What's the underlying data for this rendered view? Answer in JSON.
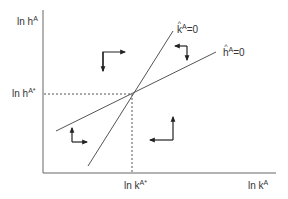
{
  "diagram": {
    "type": "phase-diagram",
    "axes": {
      "y_label": {
        "base": "ln h",
        "sup": "A"
      },
      "x_label": {
        "base": "ln k",
        "sup": "A"
      },
      "y_star_label": {
        "base": "ln h",
        "sup": "A*"
      },
      "x_star_label": {
        "base": "ln k",
        "sup": "A*"
      }
    },
    "curves": [
      {
        "id": "k-hat-locus",
        "label_base": "k",
        "label_sup": "A",
        "label_suffix": "=0",
        "slope": "steep"
      },
      {
        "id": "h-hat-locus",
        "label_base": "h",
        "label_sup": "A",
        "label_suffix": "=0",
        "slope": "shallow"
      }
    ],
    "arrows": [
      {
        "region": "top",
        "directions": [
          "right",
          "down"
        ]
      },
      {
        "region": "right-upper",
        "directions": [
          "left",
          "down"
        ]
      },
      {
        "region": "bottom-right",
        "directions": [
          "left",
          "up"
        ]
      },
      {
        "region": "left-lower",
        "directions": [
          "right",
          "up"
        ]
      }
    ],
    "colors": {
      "line": "#555555",
      "arrow": "#222222",
      "text": "#333333"
    }
  }
}
